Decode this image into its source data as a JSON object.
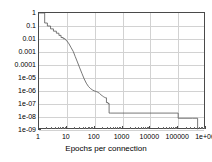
{
  "chart_data": {
    "type": "line",
    "title": "",
    "xlabel": "Epochs per connection",
    "ylabel": "",
    "xscale": "log",
    "yscale": "log",
    "xlim": [
      1,
      1000000
    ],
    "ylim": [
      1e-09,
      1
    ],
    "grid": true,
    "legend": false,
    "xticklabels": [
      "1",
      "10",
      "100",
      "1000",
      "10000",
      "100000",
      "1e+06"
    ],
    "xtickvalues": [
      1,
      10,
      100,
      1000,
      10000,
      100000,
      1000000
    ],
    "yticklabels": [
      "1",
      "0.1",
      "0.01",
      "0.001",
      "0.0001",
      "1e-05",
      "1e-06",
      "1e-07",
      "1e-08",
      "1e-09"
    ],
    "ytickvalues": [
      1,
      0.1,
      0.01,
      0.001,
      0.0001,
      1e-05,
      1e-06,
      1e-07,
      1e-08,
      1e-09
    ],
    "series": [
      {
        "name": "fraction remaining",
        "color": "#555555",
        "x": [
          1,
          1.6,
          1.6,
          2.0,
          2.0,
          2.6,
          2.6,
          3.3,
          3.3,
          4.2,
          4.2,
          5.2,
          5.2,
          6.2,
          6.2,
          7.4,
          7.4,
          8.6,
          8.6,
          10,
          12,
          14,
          17,
          20,
          24,
          29,
          35,
          42,
          50,
          60,
          72,
          86,
          100,
          115,
          130,
          150,
          170,
          190,
          210,
          230,
          250,
          265,
          265,
          300,
          300,
          330,
          330,
          360,
          360,
          100000,
          100000,
          330000,
          330000,
          500000,
          500000
        ],
        "y": [
          1.0,
          1.0,
          0.17,
          0.17,
          0.1,
          0.1,
          0.06,
          0.06,
          0.04,
          0.04,
          0.028,
          0.028,
          0.019,
          0.019,
          0.013,
          0.013,
          0.0105,
          0.0105,
          0.0095,
          0.0072,
          0.0042,
          0.0023,
          0.0011,
          0.00045,
          0.00017,
          6e-05,
          2.2e-05,
          8.5e-06,
          4e-06,
          2.2e-06,
          1.5e-06,
          1.15e-06,
          1e-06,
          9e-07,
          8e-07,
          6.5e-07,
          5e-07,
          4.2e-07,
          3.6e-07,
          3.2e-07,
          3e-07,
          3e-07,
          1.3e-07,
          1.3e-07,
          1.1e-07,
          1.1e-07,
          2e-08,
          2e-08,
          2e-08,
          2e-08,
          8e-09,
          8e-09,
          8e-09,
          8e-09,
          1.2e-09
        ]
      }
    ]
  }
}
